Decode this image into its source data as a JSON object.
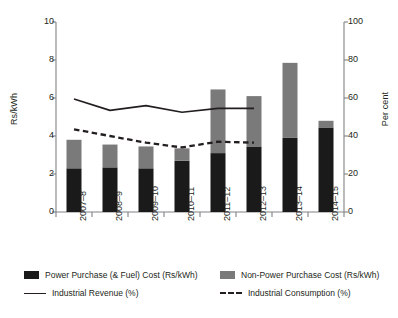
{
  "chart_data": {
    "type": "bar",
    "title": "",
    "subtitle": "",
    "xlabel": "",
    "ylabel": "Rs/kWh",
    "y2label": "Per cent",
    "ylim": [
      0,
      10
    ],
    "y2lim": [
      0,
      100
    ],
    "yticks": [
      0,
      2,
      4,
      6,
      8,
      10
    ],
    "y2ticks": [
      0,
      20,
      40,
      60,
      80,
      100
    ],
    "grid": false,
    "legend_position": "bottom",
    "categories": [
      "2007–8",
      "2008–9",
      "2009–10",
      "2010–11",
      "2011–12",
      "2012–13",
      "2013–14",
      "2014–15"
    ],
    "series": [
      {
        "name": "Power Purchase (& Fuel) Cost (Rs/kWh)",
        "type": "bar",
        "stacked": true,
        "axis": "left",
        "color": "#1a1a1a",
        "values": [
          2.3,
          2.35,
          2.3,
          2.7,
          3.1,
          3.45,
          3.9,
          4.45
        ]
      },
      {
        "name": "Non-Power Purchase Cost (Rs/kWh)",
        "type": "bar",
        "stacked": true,
        "axis": "left",
        "color": "#7a7a7a",
        "values": [
          1.5,
          1.2,
          1.15,
          0.65,
          3.35,
          2.65,
          3.95,
          0.35
        ]
      },
      {
        "name": "Industrial Revenue (%)",
        "type": "line",
        "axis": "right",
        "color": "#231f20",
        "style": "solid",
        "values": [
          59.5,
          53.5,
          56.0,
          52.5,
          54.5,
          54.5,
          null,
          null
        ]
      },
      {
        "name": "Industrial Consumption (%)",
        "type": "line",
        "axis": "right",
        "color": "#231f20",
        "style": "dashed",
        "values": [
          43.5,
          40.0,
          36.5,
          34.0,
          37.0,
          36.5,
          null,
          null
        ]
      }
    ],
    "totals": [
      3.8,
      3.55,
      3.45,
      3.35,
      6.45,
      6.1,
      7.85,
      4.8
    ]
  },
  "legend": {
    "items": [
      {
        "label": "Power Purchase (& Fuel) Cost (Rs/kWh)",
        "marker": "swatch",
        "color": "#1a1a1a"
      },
      {
        "label": "Non-Power Purchase Cost (Rs/kWh)",
        "marker": "swatch",
        "color": "#7a7a7a"
      },
      {
        "label": "Industrial Revenue (%)",
        "marker": "solid-line",
        "color": "#231f20"
      },
      {
        "label": "Industrial Consumption (%)",
        "marker": "dashed-line",
        "color": "#231f20"
      }
    ]
  },
  "colors": {
    "bar_dark": "#1a1a1a",
    "bar_gray": "#7a7a7a",
    "axis": "#808285",
    "text": "#231f20"
  }
}
